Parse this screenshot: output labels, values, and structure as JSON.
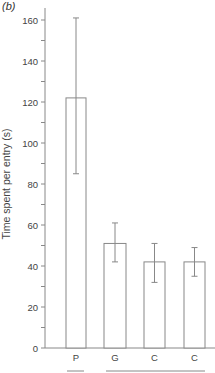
{
  "panel_label": "(b)",
  "chart_data": {
    "type": "bar",
    "title": "",
    "xlabel": "",
    "ylabel": "Time spent per entry (s)",
    "ylim": [
      0,
      160
    ],
    "yticks": [
      0,
      20,
      40,
      60,
      80,
      100,
      120,
      140,
      160
    ],
    "categories": [
      "P",
      "G",
      "C",
      "C"
    ],
    "values": [
      122,
      51,
      42,
      42
    ],
    "error_upper": [
      161,
      61,
      51,
      49
    ],
    "error_lower": [
      85,
      42,
      32,
      35
    ],
    "grid": false,
    "legend": null,
    "group_underlines": [
      [
        "P"
      ],
      [
        "G",
        "C",
        "C"
      ]
    ],
    "bar_color": "#ffffff",
    "edge_color": "#888888"
  }
}
